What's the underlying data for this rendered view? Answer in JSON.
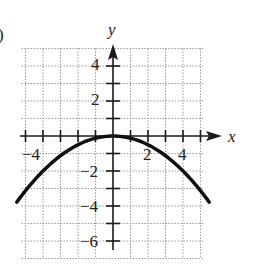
{
  "panel_label": ")",
  "chart_data": {
    "type": "line",
    "title": "",
    "xlabel": "x",
    "ylabel": "y",
    "xlim": [
      -5,
      5
    ],
    "ylim": [
      -7,
      5
    ],
    "grid": true,
    "x_tick_labels": [
      "-4",
      "2",
      "4"
    ],
    "y_tick_labels": [
      "4",
      "2",
      "-2",
      "-4",
      "-6"
    ],
    "series": [
      {
        "name": "parabola y = -x^2/8",
        "x": [
          -5.5,
          -5,
          -4,
          -3,
          -2,
          -1,
          0,
          1,
          2,
          3,
          4,
          5,
          5.5
        ],
        "y": [
          -3.78,
          -3.13,
          -2,
          -1.13,
          -0.5,
          -0.13,
          0,
          -0.13,
          -0.5,
          -1.13,
          -2,
          -3.13,
          -3.78
        ]
      }
    ]
  },
  "labels": {
    "x_axis": "x",
    "y_axis": "y",
    "xt_m4": "−4",
    "xt_2": "2",
    "xt_4": "4",
    "yt_4": "4",
    "yt_2": "2",
    "yt_m2": "−2",
    "yt_m4": "−4",
    "yt_m6": "−6"
  }
}
